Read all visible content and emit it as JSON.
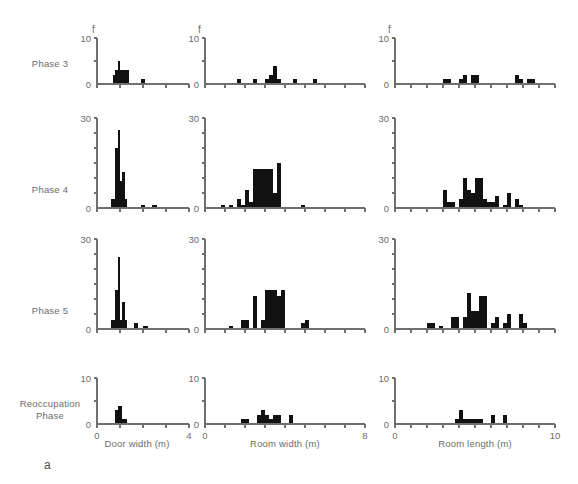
{
  "figure": {
    "panel_letter": "a",
    "frequency_symbol": "f",
    "row_labels": [
      "Phase 3",
      "Phase 4",
      "Phase 5",
      "Reoccupation\nPhase"
    ],
    "column_axis_titles": [
      "Door width (m)",
      "Room width (m)",
      "Room length (m)"
    ]
  },
  "chart_data": [
    {
      "type": "bar",
      "title": "Phase 3 — Door width",
      "row": "Phase 3",
      "column": "Door width (m)",
      "xlabel": "Door width (m)",
      "ylabel": "f",
      "xlim": [
        0,
        4
      ],
      "ylim": [
        0,
        10
      ],
      "xticks": [
        0,
        1,
        2,
        3,
        4
      ],
      "xtick_labels": [
        "0",
        "",
        "",
        "",
        "4"
      ],
      "yticks": [
        0,
        5,
        10
      ],
      "ytick_labels": [
        "0",
        "",
        "10"
      ],
      "grid": false,
      "bin_width": 0.1,
      "bin_starts": [
        0.7,
        0.8,
        0.9,
        1.0,
        1.1,
        1.2,
        1.3,
        1.9,
        2.0
      ],
      "values": [
        2,
        3,
        5,
        3,
        3,
        3,
        3,
        1,
        1
      ]
    },
    {
      "type": "bar",
      "title": "Phase 3 — Room width",
      "row": "Phase 3",
      "column": "Room width (m)",
      "xlabel": "Room width (m)",
      "ylabel": "f",
      "xlim": [
        0,
        8
      ],
      "ylim": [
        0,
        10
      ],
      "xticks": [
        0,
        1,
        2,
        3,
        4,
        5,
        6,
        7,
        8
      ],
      "xtick_labels": [
        "0",
        "",
        "",
        "",
        "",
        "",
        "",
        "",
        "8"
      ],
      "yticks": [
        0,
        5,
        10
      ],
      "ytick_labels": [
        "0",
        "",
        "10"
      ],
      "grid": false,
      "bin_width": 0.2,
      "bin_starts": [
        1.6,
        2.4,
        3.0,
        3.2,
        3.4,
        3.6,
        4.4,
        5.4
      ],
      "values": [
        1,
        1,
        1,
        2,
        4,
        1,
        1,
        1
      ]
    },
    {
      "type": "bar",
      "title": "Phase 3 — Room length",
      "row": "Phase 3",
      "column": "Room length (m)",
      "xlabel": "Room length (m)",
      "ylabel": "f",
      "xlim": [
        0,
        10
      ],
      "ylim": [
        0,
        10
      ],
      "xticks": [
        0,
        1,
        2,
        3,
        4,
        5,
        6,
        7,
        8,
        9,
        10
      ],
      "xtick_labels": [
        "0",
        "",
        "",
        "",
        "",
        "",
        "",
        "",
        "",
        "",
        "10"
      ],
      "yticks": [
        0,
        5,
        10
      ],
      "ytick_labels": [
        "0",
        "",
        "10"
      ],
      "grid": false,
      "bin_width": 0.25,
      "bin_starts": [
        3.0,
        3.25,
        4.0,
        4.25,
        4.75,
        5.0,
        7.5,
        7.75,
        8.25,
        8.5
      ],
      "values": [
        1,
        1,
        1,
        2,
        2,
        2,
        2,
        1,
        1,
        1
      ]
    },
    {
      "type": "bar",
      "title": "Phase 4 — Door width",
      "row": "Phase 4",
      "column": "Door width (m)",
      "xlabel": "Door width (m)",
      "ylabel": "f",
      "xlim": [
        0,
        4
      ],
      "ylim": [
        0,
        30
      ],
      "xticks": [
        0,
        1,
        2,
        3,
        4
      ],
      "xtick_labels": [
        "0",
        "",
        "",
        "",
        "4"
      ],
      "yticks": [
        0,
        5,
        10,
        15,
        20,
        25,
        30
      ],
      "ytick_labels": [
        "0",
        "",
        "",
        "",
        "",
        "",
        "30"
      ],
      "grid": false,
      "bin_width": 0.1,
      "bin_starts": [
        0.6,
        0.7,
        0.8,
        0.9,
        1.0,
        1.1,
        1.2,
        1.9,
        2.0,
        2.4,
        2.5
      ],
      "values": [
        3,
        3,
        20,
        26,
        9,
        12,
        3,
        1,
        1,
        1,
        1
      ]
    },
    {
      "type": "bar",
      "title": "Phase 4 — Room width",
      "row": "Phase 4",
      "column": "Room width (m)",
      "xlabel": "Room width (m)",
      "ylabel": "f",
      "xlim": [
        0,
        8
      ],
      "ylim": [
        0,
        30
      ],
      "xticks": [
        0,
        1,
        2,
        3,
        4,
        5,
        6,
        7,
        8
      ],
      "xtick_labels": [
        "0",
        "",
        "",
        "",
        "",
        "",
        "",
        "",
        "8"
      ],
      "yticks": [
        0,
        5,
        10,
        15,
        20,
        25,
        30
      ],
      "ytick_labels": [
        "0",
        "",
        "",
        "",
        "",
        "",
        "30"
      ],
      "grid": false,
      "bin_width": 0.2,
      "bin_starts": [
        0.8,
        1.2,
        1.6,
        1.8,
        2.0,
        2.2,
        2.4,
        2.6,
        2.8,
        3.0,
        3.2,
        3.4,
        3.6,
        4.8
      ],
      "values": [
        1,
        1,
        3,
        1,
        6,
        2,
        13,
        13,
        13,
        13,
        13,
        5,
        15,
        1
      ]
    },
    {
      "type": "bar",
      "title": "Phase 4 — Room length",
      "row": "Phase 4",
      "column": "Room length (m)",
      "xlabel": "Room length (m)",
      "ylabel": "f",
      "xlim": [
        0,
        10
      ],
      "ylim": [
        0,
        30
      ],
      "xticks": [
        0,
        1,
        2,
        3,
        4,
        5,
        6,
        7,
        8,
        9,
        10
      ],
      "xtick_labels": [
        "0",
        "",
        "",
        "",
        "",
        "",
        "",
        "",
        "",
        "",
        "10"
      ],
      "yticks": [
        0,
        5,
        10,
        15,
        20,
        25,
        30
      ],
      "ytick_labels": [
        "0",
        "",
        "",
        "",
        "",
        "",
        "30"
      ],
      "grid": false,
      "bin_width": 0.25,
      "bin_starts": [
        3.0,
        3.25,
        3.5,
        4.0,
        4.25,
        4.5,
        4.75,
        5.0,
        5.25,
        5.5,
        5.75,
        6.0,
        6.25,
        6.75,
        7.0,
        7.5,
        7.75
      ],
      "values": [
        6,
        2,
        2,
        3,
        10,
        6,
        5,
        10,
        10,
        3,
        2,
        2,
        4,
        1,
        5,
        3,
        1
      ]
    },
    {
      "type": "bar",
      "title": "Phase 5 — Door width",
      "row": "Phase 5",
      "column": "Door width (m)",
      "xlabel": "Door width (m)",
      "ylabel": "f",
      "xlim": [
        0,
        4
      ],
      "ylim": [
        0,
        30
      ],
      "xticks": [
        0,
        1,
        2,
        3,
        4
      ],
      "xtick_labels": [
        "0",
        "",
        "",
        "",
        "4"
      ],
      "yticks": [
        0,
        5,
        10,
        15,
        20,
        25,
        30
      ],
      "ytick_labels": [
        "0",
        "",
        "",
        "",
        "",
        "",
        "30"
      ],
      "grid": false,
      "bin_width": 0.1,
      "bin_starts": [
        0.6,
        0.7,
        0.8,
        0.9,
        1.0,
        1.1,
        1.2,
        1.6,
        1.7,
        2.0,
        2.1
      ],
      "values": [
        3,
        3,
        13,
        24,
        3,
        9,
        3,
        2,
        2,
        1,
        1
      ]
    },
    {
      "type": "bar",
      "title": "Phase 5 — Room width",
      "row": "Phase 5",
      "column": "Room width (m)",
      "xlabel": "Room width (m)",
      "ylabel": "f",
      "xlim": [
        0,
        8
      ],
      "ylim": [
        0,
        30
      ],
      "xticks": [
        0,
        1,
        2,
        3,
        4,
        5,
        6,
        7,
        8
      ],
      "xtick_labels": [
        "0",
        "",
        "",
        "",
        "",
        "",
        "",
        "",
        "8"
      ],
      "yticks": [
        0,
        5,
        10,
        15,
        20,
        25,
        30
      ],
      "ytick_labels": [
        "0",
        "",
        "",
        "",
        "",
        "",
        "30"
      ],
      "grid": false,
      "bin_width": 0.2,
      "bin_starts": [
        1.2,
        1.8,
        2.0,
        2.4,
        2.8,
        3.0,
        3.2,
        3.4,
        3.6,
        3.8,
        4.8,
        5.0
      ],
      "values": [
        1,
        3,
        3,
        11,
        3,
        13,
        13,
        13,
        11,
        13,
        2,
        3
      ]
    },
    {
      "type": "bar",
      "title": "Phase 5 — Room length",
      "row": "Phase 5",
      "column": "Room length (m)",
      "xlabel": "Room length (m)",
      "ylabel": "f",
      "xlim": [
        0,
        10
      ],
      "ylim": [
        0,
        30
      ],
      "xticks": [
        0,
        1,
        2,
        3,
        4,
        5,
        6,
        7,
        8,
        9,
        10
      ],
      "xtick_labels": [
        "0",
        "",
        "",
        "",
        "",
        "",
        "",
        "",
        "",
        "",
        "10"
      ],
      "yticks": [
        0,
        5,
        10,
        15,
        20,
        25,
        30
      ],
      "ytick_labels": [
        "0",
        "",
        "",
        "",
        "",
        "",
        "30"
      ],
      "grid": false,
      "bin_width": 0.25,
      "bin_starts": [
        2.0,
        2.25,
        2.75,
        3.5,
        3.75,
        4.25,
        4.5,
        4.75,
        5.0,
        5.25,
        5.5,
        6.0,
        6.25,
        6.75,
        7.0,
        7.75,
        8.0
      ],
      "values": [
        2,
        2,
        1,
        4,
        4,
        4,
        12,
        6,
        6,
        11,
        11,
        2,
        4,
        2,
        5,
        5,
        2
      ]
    },
    {
      "type": "bar",
      "title": "Reoccupation Phase — Door width",
      "row": "Reoccupation Phase",
      "column": "Door width (m)",
      "xlabel": "Door width (m)",
      "ylabel": "f",
      "xlim": [
        0,
        4
      ],
      "ylim": [
        0,
        10
      ],
      "xticks": [
        0,
        1,
        2,
        3,
        4
      ],
      "xtick_labels": [
        "0",
        "",
        "",
        "",
        "4"
      ],
      "yticks": [
        0,
        5,
        10
      ],
      "ytick_labels": [
        "0",
        "",
        "10"
      ],
      "grid": false,
      "bin_width": 0.1,
      "bin_starts": [
        0.8,
        0.9,
        1.0,
        1.1,
        1.2
      ],
      "values": [
        3,
        4,
        4,
        1,
        1
      ]
    },
    {
      "type": "bar",
      "title": "Reoccupation Phase — Room width",
      "row": "Reoccupation Phase",
      "column": "Room width (m)",
      "xlabel": "Room width (m)",
      "ylabel": "f",
      "xlim": [
        0,
        8
      ],
      "ylim": [
        0,
        10
      ],
      "xticks": [
        0,
        1,
        2,
        3,
        4,
        5,
        6,
        7,
        8
      ],
      "xtick_labels": [
        "0",
        "",
        "",
        "",
        "",
        "",
        "",
        "",
        "8"
      ],
      "yticks": [
        0,
        5,
        10
      ],
      "ytick_labels": [
        "0",
        "",
        "10"
      ],
      "grid": false,
      "bin_width": 0.2,
      "bin_starts": [
        1.8,
        2.0,
        2.6,
        2.8,
        3.0,
        3.2,
        3.4,
        3.6,
        4.2
      ],
      "values": [
        1,
        1,
        2,
        3,
        2,
        1,
        2,
        2,
        2
      ]
    },
    {
      "type": "bar",
      "title": "Reoccupation Phase — Room length",
      "row": "Reoccupation Phase",
      "column": "Room length (m)",
      "xlabel": "Room length (m)",
      "ylabel": "f",
      "xlim": [
        0,
        10
      ],
      "ylim": [
        0,
        10
      ],
      "xticks": [
        0,
        1,
        2,
        3,
        4,
        5,
        6,
        7,
        8,
        9,
        10
      ],
      "xtick_labels": [
        "0",
        "",
        "",
        "",
        "",
        "",
        "",
        "",
        "",
        "",
        "10"
      ],
      "yticks": [
        0,
        5,
        10
      ],
      "ytick_labels": [
        "0",
        "",
        "10"
      ],
      "grid": false,
      "bin_width": 0.25,
      "bin_starts": [
        3.75,
        4.0,
        4.25,
        4.5,
        4.75,
        5.0,
        5.25,
        6.0,
        6.75
      ],
      "values": [
        1,
        3,
        1,
        1,
        1,
        1,
        1,
        2,
        2
      ]
    }
  ]
}
